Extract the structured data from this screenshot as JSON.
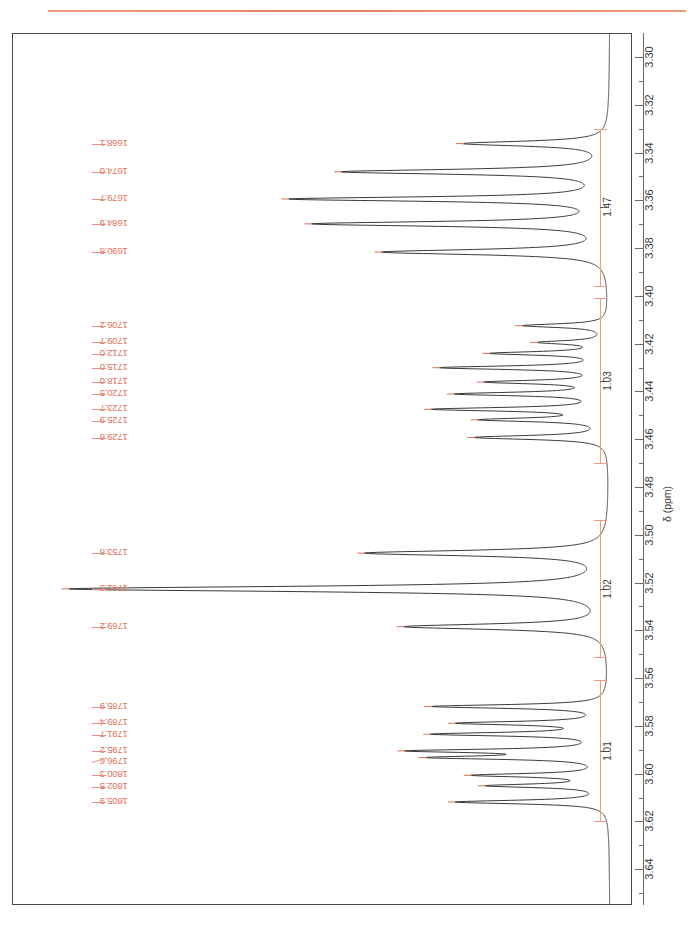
{
  "figure": {
    "kind": "nmr-spectrum",
    "nucleus_axis_label": "δ (ppm)",
    "top_rule_color": "#e8835c",
    "trace_color": "#3a3a3a",
    "label_color": "#e2705a",
    "integral_color": "#ef9c84",
    "axis_color": "#6a6a6a"
  },
  "chart_data": {
    "type": "line",
    "title": "",
    "subtitle": "",
    "xlabel": "δ (ppm)",
    "ylabel": "",
    "orientation": "vertical-ppm-axis-descending-downward",
    "grid": false,
    "legend": "none",
    "xlim": [
      3.29,
      3.655
    ],
    "axis_ticks_major": [
      "3.30",
      "3.32",
      "3.34",
      "3.36",
      "3.38",
      "3.40",
      "3.42",
      "3.44",
      "3.46",
      "3.48",
      "3.50",
      "3.52",
      "3.54",
      "3.56",
      "3.58",
      "3.60",
      "3.62",
      "3.64"
    ],
    "axis_tick_values": [
      3.3,
      3.32,
      3.34,
      3.36,
      3.38,
      3.4,
      3.42,
      3.44,
      3.46,
      3.48,
      3.5,
      3.52,
      3.54,
      3.56,
      3.58,
      3.6,
      3.62,
      3.64
    ],
    "axis_minor_step": 0.01,
    "peak_label_unit": "Hz",
    "peak_labels": [
      {
        "hz": "1668.1",
        "ppm": 3.3363
      },
      {
        "hz": "1674.0",
        "ppm": 3.3481
      },
      {
        "hz": "1679.7",
        "ppm": 3.3595
      },
      {
        "hz": "1684.9",
        "ppm": 3.3699
      },
      {
        "hz": "1690.8",
        "ppm": 3.3817
      },
      {
        "hz": "1706.2",
        "ppm": 3.4125
      },
      {
        "hz": "1709.7",
        "ppm": 3.4195
      },
      {
        "hz": "1712.0",
        "ppm": 3.4241
      },
      {
        "hz": "1715.0",
        "ppm": 3.4301
      },
      {
        "hz": "1718.0",
        "ppm": 3.4361
      },
      {
        "hz": "1720.5",
        "ppm": 3.4411
      },
      {
        "hz": "1723.7",
        "ppm": 3.4475
      },
      {
        "hz": "1725.9",
        "ppm": 3.4519
      },
      {
        "hz": "1729.6",
        "ppm": 3.4593
      },
      {
        "hz": "1753.8",
        "ppm": 3.5077
      },
      {
        "hz": "1761.3",
        "ppm": 3.5227
      },
      {
        "hz": "1769.2",
        "ppm": 3.5385
      },
      {
        "hz": "1785.9",
        "ppm": 3.5719
      },
      {
        "hz": "1789.4",
        "ppm": 3.5789
      },
      {
        "hz": "1791.7",
        "ppm": 3.5835
      },
      {
        "hz": "1795.2",
        "ppm": 3.5905
      },
      {
        "hz": "1796.6",
        "ppm": 3.5933
      },
      {
        "hz": "1800.3",
        "ppm": 3.6007
      },
      {
        "hz": "1802.5",
        "ppm": 3.6051
      },
      {
        "hz": "1805.9",
        "ppm": 3.6119
      }
    ],
    "integrals": [
      {
        "value": "1.47",
        "from_ppm": 3.33,
        "to_ppm": 3.396
      },
      {
        "value": "1.03",
        "from_ppm": 3.401,
        "to_ppm": 3.47
      },
      {
        "value": "1.02",
        "from_ppm": 3.494,
        "to_ppm": 3.551
      },
      {
        "value": "1.01",
        "from_ppm": 3.561,
        "to_ppm": 3.62
      }
    ],
    "multiplets": [
      {
        "center_ppm": 3.358,
        "integral": "1.47",
        "n_lines": 5
      },
      {
        "center_ppm": 3.436,
        "integral": "1.03",
        "n_lines": 9
      },
      {
        "center_ppm": 3.523,
        "integral": "1.02",
        "n_lines": 3
      },
      {
        "center_ppm": 3.592,
        "integral": "1.01",
        "n_lines": 8
      }
    ]
  }
}
